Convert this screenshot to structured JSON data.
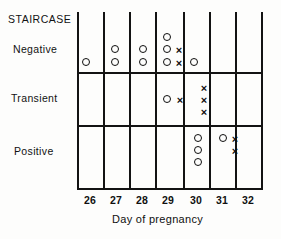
{
  "figure": {
    "title_label": "STAIRCASE",
    "axis_title": "Day of pregnancy",
    "row_labels": [
      "Negative",
      "Transient",
      "Positive"
    ],
    "tick_labels": [
      "26",
      "27",
      "28",
      "29",
      "30",
      "31",
      "32"
    ],
    "ink_color": "#121212",
    "background_color": "#fdfdfc"
  },
  "chart_data": {
    "type": "scatter",
    "title": "STAIRCASE",
    "xlabel": "Day of pregnancy",
    "ylabel": "",
    "x": [
      26,
      27,
      28,
      29,
      30,
      31,
      32
    ],
    "categories": [
      "Negative",
      "Transient",
      "Positive"
    ],
    "grid": true,
    "legend": "none",
    "marker_types": [
      "circle",
      "cross"
    ],
    "counts": [
      {
        "row": "Negative",
        "day": 26,
        "circle": 1,
        "cross": 0
      },
      {
        "row": "Negative",
        "day": 27,
        "circle": 2,
        "cross": 0
      },
      {
        "row": "Negative",
        "day": 28,
        "circle": 2,
        "cross": 0
      },
      {
        "row": "Negative",
        "day": 29,
        "circle": 3,
        "cross": 2
      },
      {
        "row": "Negative",
        "day": 30,
        "circle": 1,
        "cross": 0
      },
      {
        "row": "Negative",
        "day": 31,
        "circle": 0,
        "cross": 0
      },
      {
        "row": "Negative",
        "day": 32,
        "circle": 0,
        "cross": 0
      },
      {
        "row": "Transient",
        "day": 26,
        "circle": 0,
        "cross": 0
      },
      {
        "row": "Transient",
        "day": 27,
        "circle": 0,
        "cross": 0
      },
      {
        "row": "Transient",
        "day": 28,
        "circle": 0,
        "cross": 0
      },
      {
        "row": "Transient",
        "day": 29,
        "circle": 1,
        "cross": 1
      },
      {
        "row": "Transient",
        "day": 30,
        "circle": 0,
        "cross": 3
      },
      {
        "row": "Transient",
        "day": 31,
        "circle": 0,
        "cross": 0
      },
      {
        "row": "Transient",
        "day": 32,
        "circle": 0,
        "cross": 0
      },
      {
        "row": "Positive",
        "day": 26,
        "circle": 0,
        "cross": 0
      },
      {
        "row": "Positive",
        "day": 27,
        "circle": 0,
        "cross": 0
      },
      {
        "row": "Positive",
        "day": 28,
        "circle": 0,
        "cross": 0
      },
      {
        "row": "Positive",
        "day": 29,
        "circle": 0,
        "cross": 0
      },
      {
        "row": "Positive",
        "day": 30,
        "circle": 3,
        "cross": 0
      },
      {
        "row": "Positive",
        "day": 31,
        "circle": 1,
        "cross": 2
      },
      {
        "row": "Positive",
        "day": 32,
        "circle": 0,
        "cross": 0
      }
    ],
    "markers": [
      {
        "row": "Negative",
        "day": 26,
        "type": "circle",
        "x": 82,
        "y": 58
      },
      {
        "row": "Negative",
        "day": 27,
        "type": "circle",
        "x": 111,
        "y": 45
      },
      {
        "row": "Negative",
        "day": 27,
        "type": "circle",
        "x": 111,
        "y": 58
      },
      {
        "row": "Negative",
        "day": 28,
        "type": "circle",
        "x": 139,
        "y": 45
      },
      {
        "row": "Negative",
        "day": 28,
        "type": "circle",
        "x": 139,
        "y": 58
      },
      {
        "row": "Negative",
        "day": 29,
        "type": "circle",
        "x": 163,
        "y": 33
      },
      {
        "row": "Negative",
        "day": 29,
        "type": "circle",
        "x": 163,
        "y": 45
      },
      {
        "row": "Negative",
        "day": 29,
        "type": "circle",
        "x": 163,
        "y": 58
      },
      {
        "row": "Negative",
        "day": 29,
        "type": "cross",
        "x": 175,
        "y": 45
      },
      {
        "row": "Negative",
        "day": 29,
        "type": "cross",
        "x": 175,
        "y": 58
      },
      {
        "row": "Negative",
        "day": 30,
        "type": "circle",
        "x": 190,
        "y": 58
      },
      {
        "row": "Transient",
        "day": 29,
        "type": "circle",
        "x": 163,
        "y": 95
      },
      {
        "row": "Transient",
        "day": 29,
        "type": "cross",
        "x": 176,
        "y": 95
      },
      {
        "row": "Transient",
        "day": 30,
        "type": "cross",
        "x": 200,
        "y": 83
      },
      {
        "row": "Transient",
        "day": 30,
        "type": "cross",
        "x": 200,
        "y": 95
      },
      {
        "row": "Transient",
        "day": 30,
        "type": "cross",
        "x": 200,
        "y": 107
      },
      {
        "row": "Positive",
        "day": 30,
        "type": "circle",
        "x": 194,
        "y": 134
      },
      {
        "row": "Positive",
        "day": 30,
        "type": "circle",
        "x": 194,
        "y": 146
      },
      {
        "row": "Positive",
        "day": 30,
        "type": "circle",
        "x": 194,
        "y": 158
      },
      {
        "row": "Positive",
        "day": 31,
        "type": "circle",
        "x": 219,
        "y": 134
      },
      {
        "row": "Positive",
        "day": 31,
        "type": "cross",
        "x": 231,
        "y": 134
      },
      {
        "row": "Positive",
        "day": 31,
        "type": "cross",
        "x": 231,
        "y": 146
      }
    ]
  },
  "geometry": {
    "vlines_x": [
      77,
      103,
      129,
      155,
      183,
      209,
      235,
      261
    ],
    "hlines": [
      {
        "y": 72,
        "x1": 77,
        "x2": 261
      },
      {
        "y": 125,
        "x1": 77,
        "x2": 261
      },
      {
        "y": 188,
        "x1": 77,
        "x2": 261
      }
    ],
    "vline_top": 12,
    "vline_bottom": 188,
    "tick_label_y": 195,
    "tick_label_x": [
      77,
      103,
      129,
      155,
      183,
      209,
      235
    ],
    "title_pos": {
      "x": 8,
      "y": 14
    },
    "row_label_pos": [
      {
        "x": 13,
        "y": 44
      },
      {
        "x": 11,
        "y": 93
      },
      {
        "x": 14,
        "y": 146
      }
    ],
    "axis_title_pos": {
      "x": 112,
      "y": 214
    }
  }
}
